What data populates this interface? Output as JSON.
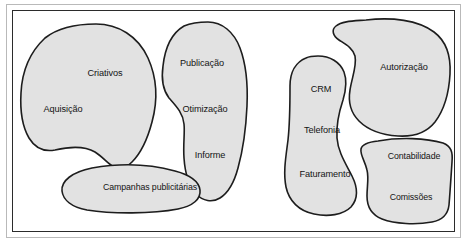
{
  "diagram": {
    "type": "blob-cluster-diagram",
    "title": "",
    "frame": {
      "outer_border_color": "#b9b9b9",
      "inner_border_color": "#2b2b2b",
      "background_color": "#ffffff"
    },
    "style": {
      "blob_fill": "#e2e2e2",
      "blob_stroke": "#1d1d1d",
      "label_color": "#141414"
    },
    "clusters": [
      {
        "name": "left-cluster",
        "shapes": [
          {
            "id": "blob-criativos-aquisicao",
            "labels": [
              {
                "text": "Criativos",
                "x": 105,
                "y": 74
              },
              {
                "text": "Aquisição",
                "x": 63,
                "y": 110
              }
            ]
          },
          {
            "id": "blob-publicacao-otimizacao-informe",
            "labels": [
              {
                "text": "Publicação",
                "x": 202,
                "y": 64
              },
              {
                "text": "Otimização",
                "x": 205,
                "y": 110
              },
              {
                "text": "Informe",
                "x": 210,
                "y": 156
              }
            ]
          },
          {
            "id": "blob-campanhas",
            "labels": [
              {
                "text": "Campanhas publicitárias",
                "x": 150,
                "y": 188
              }
            ]
          }
        ]
      },
      {
        "name": "right-cluster",
        "shapes": [
          {
            "id": "blob-crm-telefonia-faturamento",
            "labels": [
              {
                "text": "CRM",
                "x": 321,
                "y": 90
              },
              {
                "text": "Telefonia",
                "x": 322,
                "y": 131
              },
              {
                "text": "Faturamento",
                "x": 325,
                "y": 175
              }
            ]
          },
          {
            "id": "blob-autorizacao",
            "labels": [
              {
                "text": "Autorização",
                "x": 404,
                "y": 68
              }
            ]
          },
          {
            "id": "blob-contabilidade-comissoes",
            "labels": [
              {
                "text": "Contabilidade",
                "x": 414,
                "y": 157
              },
              {
                "text": "Comissões",
                "x": 411,
                "y": 198
              }
            ]
          }
        ]
      }
    ]
  }
}
